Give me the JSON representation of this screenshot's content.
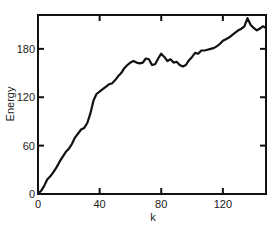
{
  "chart_data": {
    "type": "line",
    "title": "",
    "xlabel": "k",
    "ylabel": "Energy",
    "xlim": [
      0,
      148
    ],
    "ylim": [
      0,
      222
    ],
    "x_ticks": [
      0,
      40,
      80,
      120
    ],
    "y_ticks": [
      0,
      60,
      120,
      180
    ],
    "grid": false,
    "legend": null,
    "series": [
      {
        "name": "Energy",
        "x": [
          0,
          2,
          4,
          6,
          8,
          10,
          12,
          14,
          16,
          18,
          20,
          22,
          24,
          26,
          28,
          30,
          32,
          34,
          36,
          38,
          40,
          42,
          44,
          46,
          48,
          50,
          52,
          54,
          56,
          58,
          60,
          62,
          64,
          66,
          68,
          70,
          72,
          74,
          76,
          78,
          80,
          82,
          84,
          86,
          88,
          90,
          92,
          94,
          96,
          98,
          100,
          102,
          104,
          106,
          108,
          110,
          112,
          114,
          116,
          118,
          120,
          122,
          124,
          126,
          128,
          130,
          132,
          134,
          136,
          138,
          140,
          142,
          144,
          146,
          148
        ],
        "values": [
          0,
          4,
          10,
          18,
          22,
          27,
          33,
          40,
          46,
          52,
          56,
          62,
          70,
          75,
          80,
          82,
          88,
          100,
          116,
          124,
          127,
          130,
          133,
          136,
          137,
          141,
          146,
          150,
          156,
          160,
          163,
          165,
          163,
          162,
          163,
          168,
          167,
          160,
          161,
          168,
          174,
          170,
          165,
          167,
          163,
          164,
          160,
          158,
          160,
          166,
          170,
          175,
          174,
          178,
          178,
          179,
          180,
          181,
          183,
          186,
          190,
          192,
          194,
          197,
          200,
          203,
          205,
          208,
          218,
          210,
          206,
          203,
          205,
          208,
          206
        ]
      }
    ]
  },
  "axes": {
    "x_tick_labels": [
      "0",
      "40",
      "80",
      "120"
    ],
    "y_tick_labels": [
      "0",
      "60",
      "120",
      "180"
    ],
    "x_label": "k",
    "y_label": "Energy"
  }
}
